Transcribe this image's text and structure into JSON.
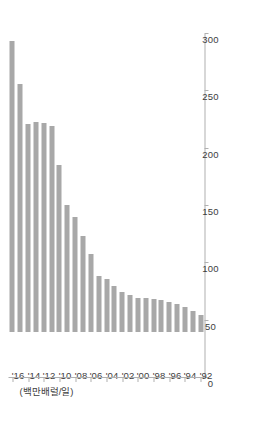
{
  "chart_data": {
    "type": "bar",
    "orientation": "horizontal",
    "title": "",
    "subtitle": "",
    "xlabel": "",
    "ylabel": "(백만배럴/일)",
    "unit_label": "(백만배럴/일)",
    "value_axis_ticks": [
      "0",
      "50",
      "100",
      "150",
      "200",
      "250",
      "300"
    ],
    "value_axis_tick_values": [
      0,
      50,
      100,
      150,
      200,
      250,
      300
    ],
    "xlim": [
      0,
      300
    ],
    "grid": false,
    "legend": null,
    "bar_color": "#a8a8a8",
    "axis_color": "#b0b0b0",
    "text_color": "#3d3d3d",
    "categories": [
      "'92",
      "'93",
      "'94",
      "'95",
      "'96",
      "'97",
      "'98",
      "'99",
      "'00",
      "'01",
      "'02",
      "'03",
      "'04",
      "'05",
      "'06",
      "'07",
      "'08",
      "'09",
      "'10",
      "'11",
      "'12",
      "'13",
      "'14",
      "'15",
      "'16"
    ],
    "visible_tick_labels": [
      "'92",
      "'94",
      "'96",
      "'98",
      "'00",
      "'02",
      "'04",
      "'06",
      "'08",
      "'10",
      "'12",
      "'14",
      "'16"
    ],
    "values": [
      15,
      18,
      22,
      24,
      26,
      28,
      29,
      30,
      30,
      32,
      35,
      40,
      46,
      49,
      68,
      84,
      100,
      111,
      146,
      180,
      182,
      183,
      181,
      216,
      254
    ]
  }
}
